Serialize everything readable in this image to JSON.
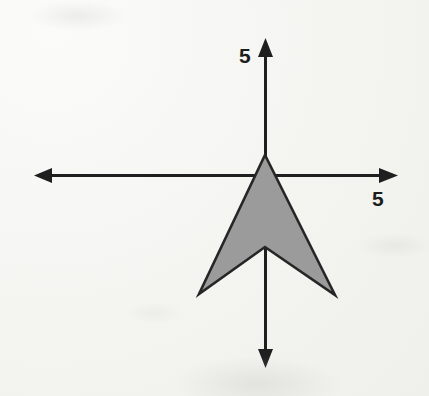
{
  "figure": {
    "background_color": "#f6f6f3",
    "grid": {
      "color": "#c5c5c2",
      "spacing_px": 24,
      "style": "dotted",
      "x_start_px": 45,
      "x_end_px": 405,
      "y_start_px": 31,
      "y_end_px": 367,
      "columns": 15,
      "rows": 14
    },
    "axes": {
      "color": "#1f1f1f",
      "origin_px": {
        "x": 265,
        "y": 175
      },
      "x_axis": {
        "y_px": 175,
        "from_px": 36,
        "to_px": 397,
        "arrows": "both"
      },
      "y_axis": {
        "x_px": 265,
        "from_px": 40,
        "to_px": 366,
        "arrows": "both"
      }
    },
    "labels": {
      "y_axis_tick": "5",
      "x_axis_tick": "5"
    },
    "shape": {
      "name": "arrow-polygon",
      "fill_color": "#9b9b9b",
      "stroke_color": "#262626",
      "stroke_width_px": 2.6,
      "vertices_px": [
        {
          "x": 265,
          "y": 155
        },
        {
          "x": 335,
          "y": 295
        },
        {
          "x": 265,
          "y": 247
        },
        {
          "x": 199,
          "y": 294
        }
      ]
    }
  },
  "chart_data": {
    "type": "scatter",
    "title": "",
    "xlabel": "",
    "ylabel": "",
    "grid": true,
    "legend": null,
    "xlim": [
      -9.17,
      5.83
    ],
    "ylim": [
      -8,
      6
    ],
    "xticks": [
      5
    ],
    "yticks": [
      5
    ],
    "xtick_labels": [
      "5"
    ],
    "ytick_labels": [
      "5"
    ],
    "annotations": [
      {
        "text": "5",
        "axis": "y",
        "value": 5
      },
      {
        "text": "5",
        "axis": "x",
        "value": 5
      }
    ],
    "series": [
      {
        "name": "shaded arrow polygon",
        "kind": "polygon",
        "closed": true,
        "fill": "#9b9b9b",
        "edge": "#262626",
        "x": [
          0,
          2.92,
          0,
          -2.75
        ],
        "y": [
          0.83,
          -5.0,
          -3.0,
          -4.96
        ],
        "vertex_labels": [
          "apex (0, 0.83)",
          "right barb (2.92, -5)",
          "notch (0, -3)",
          "left barb (-2.75, -4.96)"
        ]
      }
    ]
  }
}
